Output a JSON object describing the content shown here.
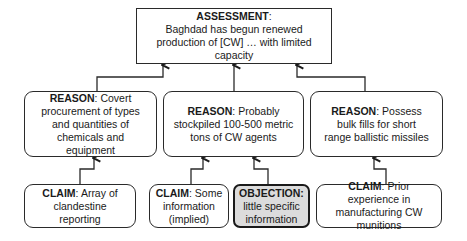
{
  "assessment": {
    "label": "ASSESSMENT",
    "sep": ":",
    "text": "Baghdad has begun renewed production of [CW] … with limited capacity"
  },
  "reasons": [
    {
      "label": "REASON",
      "sep": ": ",
      "text": "Covert procurement of types and quantities of chemicals and equipment"
    },
    {
      "label": "REASON",
      "sep": ": ",
      "text": "Probably stockpiled 100-500 metric tons of CW agents"
    },
    {
      "label": "REASON",
      "sep": ": ",
      "text": "Possess bulk fills for short range ballistic missiles"
    }
  ],
  "leaves": [
    {
      "kind": "claim",
      "label": "CLAIM",
      "sep": ": ",
      "text": "Array of clandestine reporting"
    },
    {
      "kind": "claim",
      "label": "CLAIM",
      "sep": ": ",
      "text": "Some information (implied)"
    },
    {
      "kind": "objection",
      "label": "OBJECTION:",
      "sep": " ",
      "text": "little specific information"
    },
    {
      "kind": "claim",
      "label": "CLAIM",
      "sep": ":  ",
      "text": "Prior experience in manufacturing CW munitions"
    }
  ],
  "colors": {
    "line": "#2a2a2a",
    "objection_fill": "#dcdcdc"
  }
}
